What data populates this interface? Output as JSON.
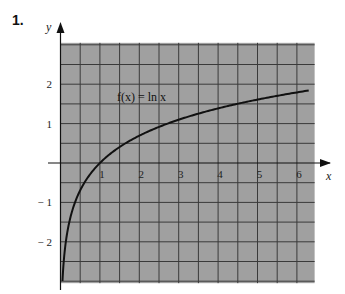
{
  "problem_number": "1.",
  "chart_data": {
    "type": "line",
    "title": "",
    "xlabel": "x",
    "ylabel": "y",
    "xlim": [
      0,
      6.45
    ],
    "ylim": [
      -3.05,
      3.05
    ],
    "grid": true,
    "grid_step": 0.5,
    "x_ticks": [
      1,
      2,
      3,
      4,
      5,
      6
    ],
    "x_tick_labels": [
      "1",
      "2",
      "3",
      "4",
      "5",
      "6"
    ],
    "y_ticks": [
      2,
      1,
      -1,
      -2
    ],
    "y_tick_labels": [
      "2",
      "1",
      "− 1",
      "− 2"
    ],
    "series": [
      {
        "name": "f(x) = ln x",
        "function": "ln(x)",
        "x_range": [
          0.05,
          6.3
        ],
        "x": [
          0.05,
          0.1,
          0.2,
          0.3,
          0.5,
          0.75,
          1,
          1.5,
          2,
          2.5,
          3,
          3.5,
          4,
          4.5,
          5,
          5.5,
          6,
          6.3
        ],
        "y": [
          -3.0,
          -2.3,
          -1.61,
          -1.2,
          -0.69,
          -0.29,
          0,
          0.41,
          0.69,
          0.92,
          1.1,
          1.25,
          1.39,
          1.5,
          1.61,
          1.7,
          1.79,
          1.84
        ]
      }
    ],
    "annotations": [
      {
        "text": "f(x) = ln x",
        "x": 2.2,
        "y": 1.65
      }
    ],
    "colors": {
      "plot_background": "#a0a0a0",
      "grid": "#3a3a3a",
      "curve": "#111111",
      "axes": "#111111"
    }
  }
}
